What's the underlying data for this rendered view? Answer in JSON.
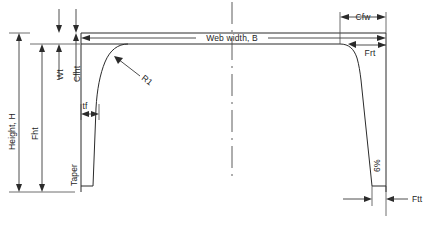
{
  "figure": {
    "type": "engineering-cross-section",
    "title": "",
    "background_color": "#ffffff",
    "line_color": "#2b2b2b",
    "text_color": "#1d1d1d"
  },
  "labels": {
    "height_h": "Height, H",
    "fht": "Fht",
    "wt": "Wt",
    "cfht": "Cfht",
    "taper": "Taper",
    "tf": "tf",
    "r1": "R1",
    "web_width_b": "Web width, B",
    "cfw": "Cfw",
    "frt": "Frt",
    "slope": "6%",
    "ftt": "Ftt"
  },
  "dimensions": [
    {
      "name": "Height, H",
      "orientation": "vertical",
      "side": "left"
    },
    {
      "name": "Fht",
      "orientation": "vertical",
      "side": "left"
    },
    {
      "name": "Wt",
      "orientation": "vertical",
      "side": "left"
    },
    {
      "name": "Cfht",
      "orientation": "vertical",
      "side": "left"
    },
    {
      "name": "Taper",
      "orientation": "vertical",
      "side": "left-inner"
    },
    {
      "name": "tf",
      "orientation": "horizontal",
      "side": "left-inner"
    },
    {
      "name": "R1",
      "orientation": "radius",
      "side": "left-fillet"
    },
    {
      "name": "Web width, B",
      "orientation": "horizontal",
      "side": "top"
    },
    {
      "name": "Cfw",
      "orientation": "horizontal",
      "side": "top-right"
    },
    {
      "name": "Frt",
      "orientation": "radius",
      "side": "right-fillet"
    },
    {
      "name": "6%",
      "orientation": "vertical",
      "side": "right"
    },
    {
      "name": "Ftt",
      "orientation": "horizontal",
      "side": "bottom-right"
    }
  ],
  "geometry": {
    "web_top_y": 33,
    "web_bottom_y": 44,
    "base_y": 192,
    "left_flange_x": 81,
    "right_flange_x": 340,
    "outer_right_x": 386,
    "center_x": 232
  }
}
